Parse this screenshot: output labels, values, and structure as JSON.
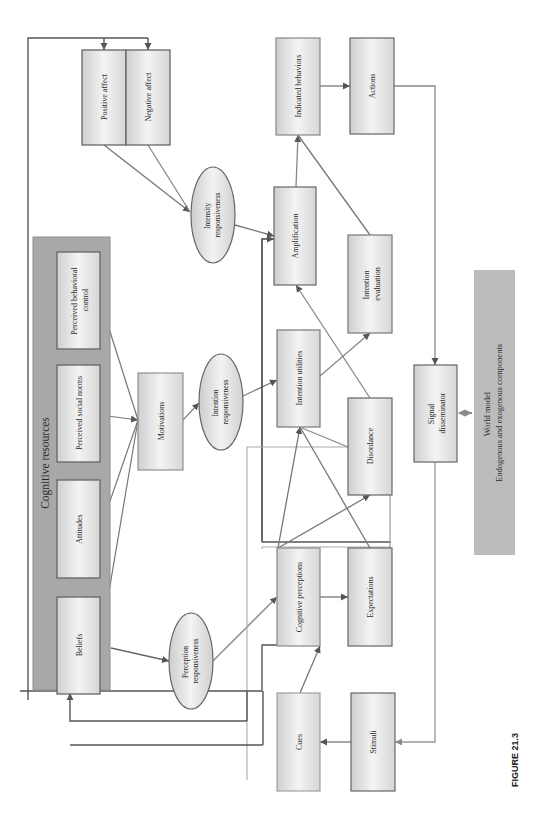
{
  "figure": {
    "caption": "FIGURE 21.3",
    "orientation": "rotated 90 degrees counter-clockwise"
  },
  "colors": {
    "box_light": "#f2f2f2",
    "box_dark": "#c9c9c9",
    "box_border": "#6a6a6a",
    "panel_fill": "#a9a9a9",
    "world_model_fill": "#bdbdbd",
    "line_dark": "#555555",
    "line_light": "#9a9a9a"
  },
  "panel": {
    "cognitive_resources": "Cognitive resources"
  },
  "nodes": {
    "positive_affect": "Positive affect",
    "negative_affect": "Negative affect",
    "intensity_responsiveness": [
      "Intensity",
      "responsiveness"
    ],
    "perceived_behavioral_control": [
      "Perceived behavioral",
      "control"
    ],
    "perceived_social_norms": "Perceived social norms",
    "attitudes": "Attitudes",
    "beliefs": "Beliefs",
    "motivations": "Motivations",
    "intention_responsiveness": [
      "Intention",
      "responsiveness"
    ],
    "perception_responsiveness": [
      "Perception",
      "responsiveness"
    ],
    "amplification": "Amplification",
    "indicated_behaviors": "Indicated behaviors",
    "actions": "Actions",
    "intention_utilities": "Intention utilities",
    "intention_evaluation": [
      "Intention",
      "evaluation"
    ],
    "disordance": "Disordance",
    "cognitive_perceptions": "Cognitive perceptions",
    "expectations": "Expectations",
    "cues": "Cues",
    "stimuli": "Stimuli",
    "signal_disseminator": [
      "Signal",
      "disseminator"
    ],
    "world_model": [
      "World model",
      "Endogenous and exogenous components"
    ]
  },
  "edges": [
    {
      "from": "Positive affect",
      "to": "Intensity responsiveness"
    },
    {
      "from": "Negative affect",
      "to": "Intensity responsiveness"
    },
    {
      "from": "Intensity responsiveness",
      "to": "Amplification"
    },
    {
      "from": "Perceived behavioral control",
      "to": "Motivations"
    },
    {
      "from": "Perceived social norms",
      "to": "Motivations"
    },
    {
      "from": "Attitudes",
      "to": "Motivations"
    },
    {
      "from": "Beliefs",
      "to": "Motivations"
    },
    {
      "from": "Beliefs",
      "to": "Perception responsiveness"
    },
    {
      "from": "Motivations",
      "to": "Intention responsiveness"
    },
    {
      "from": "Intention responsiveness",
      "to": "Intention utilities"
    },
    {
      "from": "Perception responsiveness",
      "to": "Cognitive perceptions"
    },
    {
      "from": "Amplification",
      "to": "Indicated behaviors"
    },
    {
      "from": "Intention evaluation",
      "to": "Indicated behaviors"
    },
    {
      "from": "Indicated behaviors",
      "to": "Actions"
    },
    {
      "from": "Actions",
      "to": "Signal disseminator"
    },
    {
      "from": "Signal disseminator",
      "to": "World model",
      "bidirectional": true
    },
    {
      "from": "Signal disseminator",
      "to": "Stimuli"
    },
    {
      "from": "Stimuli",
      "to": "Cues"
    },
    {
      "from": "Cues",
      "to": "Cognitive perceptions"
    },
    {
      "from": "Cognitive perceptions",
      "to": "Expectations"
    },
    {
      "from": "Cognitive perceptions",
      "to": "Intention utilities"
    },
    {
      "from": "Cognitive perceptions",
      "to": "Disordance"
    },
    {
      "from": "Expectations",
      "to": "Intention utilities"
    },
    {
      "from": "Expectations",
      "to": "Disordance"
    },
    {
      "from": "Disordance",
      "to": "Intention utilities"
    },
    {
      "from": "Disordance",
      "to": "Amplification"
    },
    {
      "from": "Intention utilities",
      "to": "Intention evaluation"
    },
    {
      "from": "Cognitive perceptions",
      "to": "Amplification"
    },
    {
      "from": "feedback",
      "to": "Positive affect"
    },
    {
      "from": "feedback",
      "to": "Negative affect"
    },
    {
      "from": "feedback",
      "to": "Cognitive resources"
    }
  ]
}
